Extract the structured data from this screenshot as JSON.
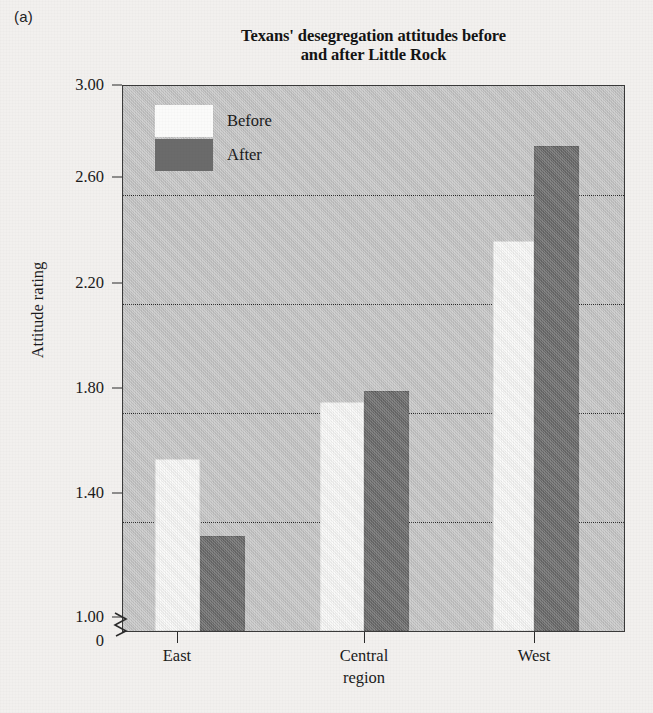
{
  "panel": {
    "label": "(a)"
  },
  "chart_data": {
    "type": "bar",
    "title": "Texans' desegregation attitudes before and after Little Rock",
    "title_line1": "Texans' desegregation attitudes before",
    "title_line2": "and after Little Rock",
    "xlabel": "region",
    "ylabel": "Attitude rating",
    "categories": [
      "East",
      "Central",
      "West"
    ],
    "series": [
      {
        "name": "Before",
        "color": "#fbfbfa",
        "values": [
          1.63,
          1.84,
          2.43
        ]
      },
      {
        "name": "After",
        "color": "#6b6b6b",
        "values": [
          1.35,
          1.88,
          2.78
        ]
      }
    ],
    "ylim": [
      1.0,
      3.0
    ],
    "y_axis_break": true,
    "y_baseline_label": "0",
    "yticks": [
      "1.00",
      "1.40",
      "1.80",
      "2.20",
      "2.60",
      "3.00"
    ],
    "ytick_values": [
      1.0,
      1.4,
      1.8,
      2.2,
      2.6,
      3.0
    ],
    "gridlines": [
      1.4,
      1.8,
      2.2,
      2.6
    ],
    "grid": true,
    "legend_position": "upper-left-inside",
    "plot_background": "#c8c8c8"
  },
  "legend": {
    "items": [
      {
        "label": "Before",
        "swatch": "white"
      },
      {
        "label": "After",
        "swatch": "dark-gray"
      }
    ]
  }
}
